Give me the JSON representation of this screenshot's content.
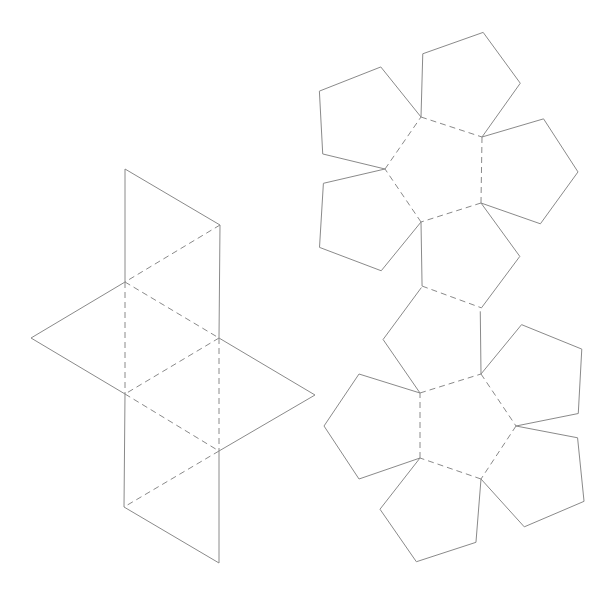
{
  "diagram": {
    "title": "",
    "nets": [
      {
        "name": "octahedron-net",
        "faces": 8,
        "face_shape": "triangle"
      },
      {
        "name": "dodecahedron-net",
        "faces": 12,
        "face_shape": "pentagon"
      }
    ],
    "line_color": "#8a8a8a",
    "cut_line_style": "solid",
    "fold_line_style": "dashed"
  }
}
